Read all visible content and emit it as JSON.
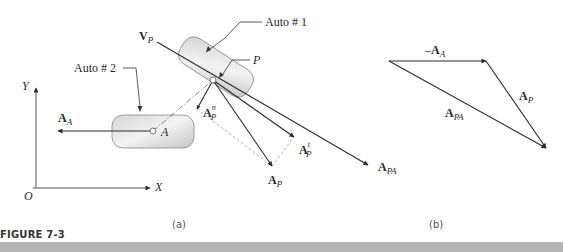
{
  "figure": {
    "label": "FIGURE 7-3",
    "bar_color": "#b5b5b5"
  },
  "panel_a": {
    "caption": "(a)",
    "axes": {
      "origin": "O",
      "x": "X",
      "y": "Y"
    },
    "callouts": {
      "auto1": "Auto # 1",
      "auto2": "Auto # 2",
      "point_p": "P"
    },
    "point_a": "A",
    "vectors": {
      "v_p": {
        "base": "V",
        "sub": "P"
      },
      "a_a": {
        "base": "A",
        "sub": "A"
      },
      "a_p_n": {
        "base": "A",
        "sub": "P",
        "sup": "n"
      },
      "a_p_t": {
        "base": "A",
        "sub": "P",
        "sup": "t"
      },
      "a_p": {
        "base": "A",
        "sub": "P"
      },
      "a_pa": {
        "base": "A",
        "sub": "PA"
      }
    },
    "colors": {
      "body_fill_light": "#f2f2f2",
      "body_fill_dark": "#c8c8c8",
      "stroke": "#333333",
      "dashed": "#999999"
    }
  },
  "panel_b": {
    "caption": "(b)",
    "vectors": {
      "neg_a_a": {
        "prefix": "–",
        "base": "A",
        "sub": "A"
      },
      "a_p": {
        "base": "A",
        "sub": "P"
      },
      "a_pa": {
        "base": "A",
        "sub": "PA"
      }
    }
  }
}
